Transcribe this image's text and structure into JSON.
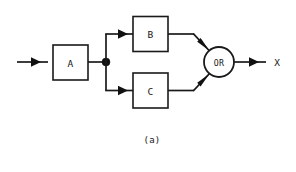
{
  "figure": {
    "caption": "(a)",
    "type": "reliability-block-diagram",
    "background_color": "#ffffff",
    "line_color": "#1a1a1a"
  },
  "blocks": [
    {
      "id": "A",
      "label": "A",
      "shape": "rectangle"
    },
    {
      "id": "B",
      "label": "B",
      "shape": "rectangle"
    },
    {
      "id": "C",
      "label": "C",
      "shape": "rectangle"
    }
  ],
  "gate": {
    "id": "OR",
    "label": "OR",
    "shape": "circle"
  },
  "signals": {
    "input_label": "",
    "output_label": "X"
  },
  "junction": {
    "label": "branch-node"
  }
}
